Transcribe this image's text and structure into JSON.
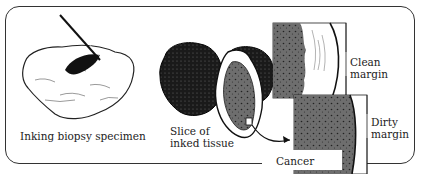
{
  "diagram": {
    "steps": [
      {
        "label": "Inking biopsy specimen"
      },
      {
        "label_line1": "Slice of",
        "label_line2": "inked tissue"
      }
    ],
    "callouts": {
      "clean_line1": "Clean",
      "clean_line2": "margin",
      "dirty_line1": "Dirty",
      "dirty_line2": "margin",
      "cancer": "Cancer"
    },
    "colors": {
      "ink": "#111111",
      "cancer_tissue": "#6e6e6e",
      "outline": "#333333",
      "background": "#ffffff"
    }
  }
}
